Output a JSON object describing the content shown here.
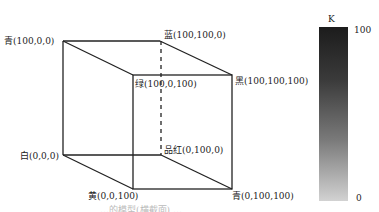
{
  "diagram": {
    "type": "cmyk-color-cube",
    "vertices": [
      {
        "id": "back-top-left",
        "label": "青(100,0,0)"
      },
      {
        "id": "back-top-right",
        "label": "蓝(100,100,0)"
      },
      {
        "id": "front-top-left",
        "label": "绿(100,0,100)"
      },
      {
        "id": "front-top-right",
        "label": "黑(100,100,100)"
      },
      {
        "id": "back-bottom-left",
        "label": "白(0,0,0)"
      },
      {
        "id": "back-bottom-right",
        "label": "品红(0,100,0)"
      },
      {
        "id": "front-bottom-left",
        "label": "黄(0,0,100)"
      },
      {
        "id": "front-bottom-right",
        "label": "青(0,100,100)"
      }
    ],
    "k_scale": {
      "title": "K",
      "max_label": "100",
      "min_label": "0"
    },
    "caption": "…的模型(横截面) …"
  },
  "colors": {
    "line": "#222222",
    "k_dark": "#1c1c1c",
    "k_light": "#d2d2d2"
  }
}
